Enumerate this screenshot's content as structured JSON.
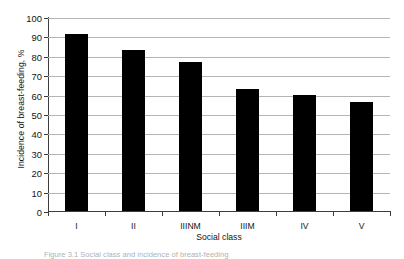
{
  "chart_data": {
    "type": "bar",
    "title": "",
    "xlabel": "Social class",
    "ylabel": "Incidence of breast-feeding, %",
    "categories": [
      "I",
      "II",
      "IIINM",
      "IIIM",
      "IV",
      "V"
    ],
    "values": [
      91,
      83,
      77,
      63,
      60,
      56
    ],
    "ylim": [
      0,
      100
    ],
    "yticks": [
      0,
      10,
      20,
      30,
      40,
      50,
      60,
      70,
      80,
      90,
      100
    ],
    "grid": true,
    "legend": "none",
    "bar_color": "#000000",
    "grid_color": "#b4b4b4",
    "axis_color": "#3d3d3d"
  },
  "figure": {
    "caption": "Figure 3.1 Social class and incidence of breast-feeding"
  }
}
